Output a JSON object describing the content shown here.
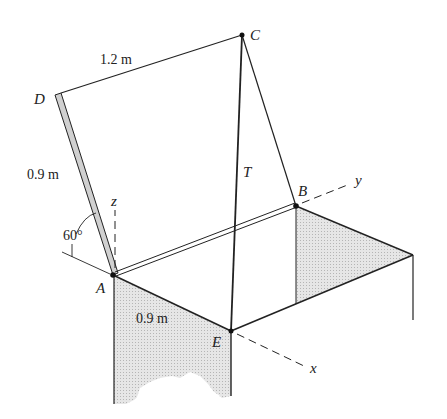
{
  "figure": {
    "points": {
      "A": {
        "label": "A",
        "x": 113,
        "y": 275
      },
      "B": {
        "label": "B",
        "x": 296,
        "y": 206
      },
      "C": {
        "label": "C",
        "x": 242,
        "y": 35
      },
      "D": {
        "label": "D",
        "x": 55,
        "y": 95
      },
      "E": {
        "label": "E",
        "x": 231,
        "y": 331
      }
    },
    "axes": {
      "x": {
        "label": "x"
      },
      "y": {
        "label": "y"
      },
      "z": {
        "label": "z"
      }
    },
    "cable": {
      "label": "T"
    },
    "dimensions": {
      "DC": "1.2 m",
      "AD": "0.9 m",
      "AE": "0.9 m"
    },
    "angle": {
      "label": "60°"
    },
    "colors": {
      "line": "#222222",
      "shade": "#d9d9d9",
      "panel_edge": "#cfcfcf"
    }
  }
}
